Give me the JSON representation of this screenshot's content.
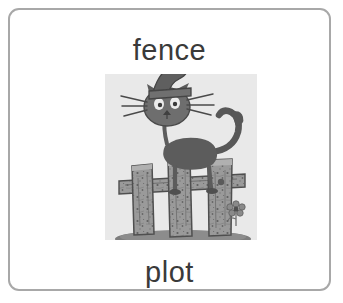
{
  "card": {
    "background_color": "#ffffff",
    "border_color": "#a8a8a8",
    "corner_radius_px": 11
  },
  "word_top": {
    "text": "fence",
    "color": "#3a3a3a"
  },
  "word_bottom": {
    "text": "plot",
    "color": "#3a3a3a"
  },
  "illustration": {
    "name": "cat-on-fence-clipart",
    "alt": "Grayscale cartoon drawing of a cat wearing a tall pointed hat standing on top of a wooden fence",
    "panel_background_color": "#e9e9e9",
    "palette": {
      "ink": "#4a4a4a",
      "dark": "#555555",
      "mid": "#7d7d7d",
      "light": "#9a9a9a",
      "wood": "#8e8e8e",
      "wood_shade": "#6e6e6e",
      "ground": "#7a7a7a",
      "highlight": "#d2d2d2"
    },
    "elements": [
      "cat-hat",
      "cat-head",
      "cat-whiskers",
      "cat-neck",
      "cat-body",
      "cat-tail",
      "cat-legs",
      "fence-post-left",
      "fence-post-middle",
      "fence-post-right",
      "fence-rail",
      "flower",
      "ground-shadow"
    ]
  }
}
